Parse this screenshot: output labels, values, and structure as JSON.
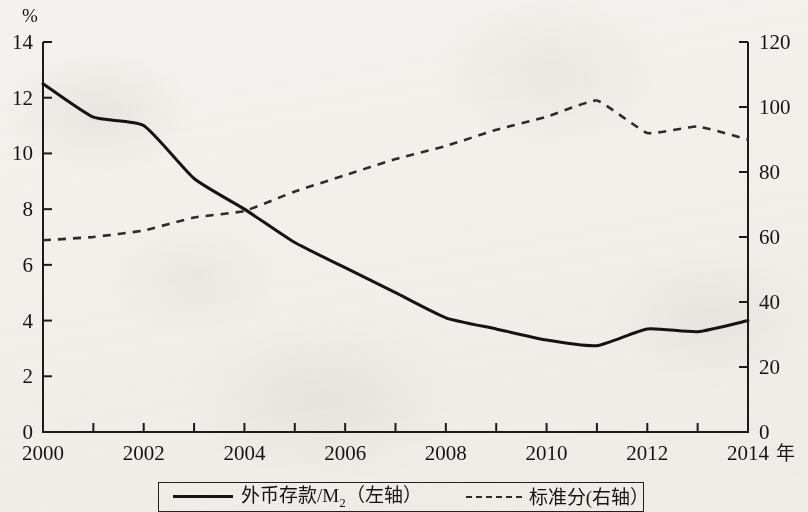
{
  "chart_data": {
    "type": "line",
    "title": "",
    "subtitle": "",
    "xlabel": "年",
    "ylabel_left": "%",
    "ylabel_right": "",
    "xlim": [
      2000,
      2014
    ],
    "ylim_left": [
      0,
      14
    ],
    "ylim_right": [
      0,
      120
    ],
    "grid": false,
    "legend_position": "bottom",
    "x": [
      2000,
      2001,
      2002,
      2003,
      2004,
      2005,
      2006,
      2007,
      2008,
      2009,
      2010,
      2011,
      2012,
      2013,
      2014
    ],
    "x_tick_labels": [
      "2000",
      "",
      "2002",
      "",
      "2004",
      "",
      "2006",
      "",
      "2008",
      "",
      "2010",
      "",
      "2012",
      "",
      "2014"
    ],
    "y_left_ticks": [
      0,
      2,
      4,
      6,
      8,
      10,
      12,
      14
    ],
    "y_right_ticks": [
      0,
      20,
      40,
      60,
      80,
      100,
      120
    ],
    "series": [
      {
        "name": "外币存款/M₂（左轴）",
        "name_plain": "外币存款/M2（左轴）",
        "axis": "left",
        "style": "solid",
        "color": "#141414",
        "values": [
          12.5,
          11.3,
          11.0,
          9.1,
          8.0,
          6.8,
          5.9,
          5.0,
          4.1,
          3.7,
          3.3,
          3.1,
          3.7,
          3.6,
          4.0
        ]
      },
      {
        "name": "标准分(右轴）",
        "name_plain": "标准分(右轴)",
        "axis": "right",
        "style": "dashed",
        "color": "#2e2c2a",
        "values": [
          59,
          60,
          62,
          66,
          68,
          74,
          79,
          84,
          88,
          93,
          97,
          102,
          92,
          94,
          90
        ]
      }
    ]
  },
  "axes": {
    "left_unit_label": "%",
    "x_unit_label": "年",
    "right_zero_label": "0"
  },
  "legend": {
    "entries": [
      {
        "label_main": "外币存款/M",
        "label_sub": "2",
        "label_tail": "（左轴）",
        "marker": "solid-line-swatch"
      },
      {
        "label_main": "标准分(右轴）",
        "label_sub": "",
        "label_tail": "",
        "marker": "dashed-line-swatch"
      }
    ]
  }
}
